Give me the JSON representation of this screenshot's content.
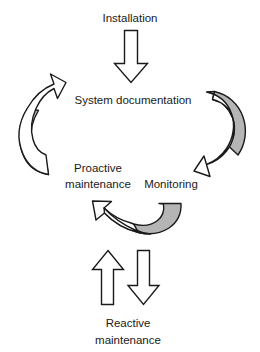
{
  "diagram": {
    "type": "cycle-diagram",
    "background_color": "#ffffff",
    "outline_color": "#1a1a1a",
    "fill_white": "#ffffff",
    "fill_gray": "#b5b5b5",
    "nodes": [
      {
        "id": "installation",
        "label": "Installation",
        "position": "top"
      },
      {
        "id": "system-documentation",
        "label": "System documentation",
        "position": "upper-center"
      },
      {
        "id": "proactive-maintenance",
        "label_line1": "Proactive",
        "label_line2": "maintenance",
        "position": "middle-left"
      },
      {
        "id": "monitoring",
        "label": "Monitoring",
        "position": "middle-right"
      },
      {
        "id": "reactive-maintenance",
        "label_line1": "Reactive",
        "label_line2": "maintenance",
        "position": "bottom"
      }
    ],
    "connectors": [
      {
        "id": "installation-to-documentation",
        "shape": "block-arrow",
        "direction": "down",
        "fill": "#ffffff"
      },
      {
        "id": "documentation-to-proactive",
        "shape": "curved-arrow",
        "direction": "up-right",
        "fill": "#b5b5b5"
      },
      {
        "id": "monitoring-to-documentation",
        "shape": "curved-arrow",
        "direction": "down-left",
        "fill": "#b5b5b5"
      },
      {
        "id": "monitoring-to-proactive",
        "shape": "curved-arrow",
        "direction": "up-left",
        "fill": "#b5b5b5"
      },
      {
        "id": "reactive-to-cycle",
        "shape": "block-arrow",
        "direction": "up",
        "fill": "#ffffff"
      },
      {
        "id": "cycle-to-reactive",
        "shape": "block-arrow",
        "direction": "down",
        "fill": "#ffffff"
      }
    ]
  }
}
